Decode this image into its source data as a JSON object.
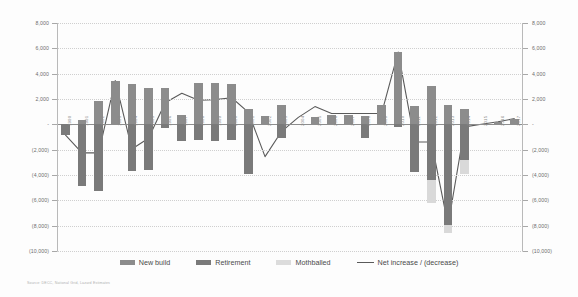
{
  "chart_data": {
    "type": "bar",
    "title": "",
    "xlabel": "",
    "ylabel": "",
    "ylim": [
      -10000,
      8000
    ],
    "y_ticks": [
      8000,
      6000,
      4000,
      2000,
      0,
      -2000,
      -4000,
      -6000,
      -8000,
      -10000
    ],
    "y_tick_labels": [
      "8,000",
      "6,000",
      "4,000",
      "2,000",
      "-",
      "(2,000)",
      "(4,000)",
      "(6,000)",
      "(8,000)",
      "(10,000)"
    ],
    "dual_axis": true,
    "grid": true,
    "legend_position": "bottom",
    "categories": [
      "1990",
      "1991",
      "1992",
      "1993",
      "1994",
      "1995",
      "1996",
      "1997",
      "1998",
      "1999",
      "2000",
      "2001",
      "2002",
      "2003",
      "2004",
      "2005",
      "2006",
      "2007",
      "2008",
      "2009",
      "2010",
      "2011",
      "2012",
      "2013",
      "2014",
      "2015",
      "2016",
      "2017"
    ],
    "series": [
      {
        "name": "New build",
        "color": "#8c8c8c",
        "values": [
          0,
          330,
          1850,
          3450,
          3150,
          2880,
          2900,
          760,
          3250,
          3250,
          3200,
          1200,
          640,
          1540,
          0,
          590,
          750,
          720,
          680,
          1500,
          5700,
          1450,
          3000,
          1500,
          1200,
          0,
          200,
          450
        ]
      },
      {
        "name": "Retirement",
        "color": "#7a7a7a",
        "values": [
          -830,
          -4900,
          -5250,
          0,
          -3700,
          -3600,
          -300,
          -1350,
          -1250,
          -1300,
          -1200,
          -3900,
          0,
          -1100,
          0,
          0,
          0,
          0,
          -1100,
          0,
          -220,
          -3750,
          -4400,
          -7950,
          -2800,
          0,
          0,
          0
        ]
      },
      {
        "name": "Mothballed",
        "color": "#d9d9d9",
        "values": [
          0,
          0,
          0,
          0,
          0,
          0,
          0,
          0,
          0,
          0,
          0,
          0,
          0,
          0,
          0,
          0,
          0,
          0,
          0,
          0,
          0,
          0,
          -1800,
          -600,
          -1150,
          0,
          0,
          0
        ]
      }
    ],
    "line_series": {
      "name": "Net increase / (decrease)",
      "color": "#5a5a5a",
      "values": [
        -830,
        -2250,
        -2250,
        3450,
        -1950,
        -1100,
        1700,
        2450,
        1900,
        1950,
        2100,
        950,
        -2550,
        -550,
        550,
        1400,
        850,
        850,
        850,
        850,
        5700,
        -1400,
        -1400,
        -7950,
        -200,
        0,
        200,
        450
      ]
    }
  },
  "legend": {
    "items": [
      {
        "label": "New build",
        "type": "swatch-nb"
      },
      {
        "label": "Retirement",
        "type": "swatch-rt"
      },
      {
        "label": "Mothballed",
        "type": "swatch-mb"
      },
      {
        "label": "Net increase / (decrease)",
        "type": "swatch-line"
      }
    ]
  },
  "source": {
    "text": "Source: DECC, National Grid, Lazard Estimates"
  }
}
